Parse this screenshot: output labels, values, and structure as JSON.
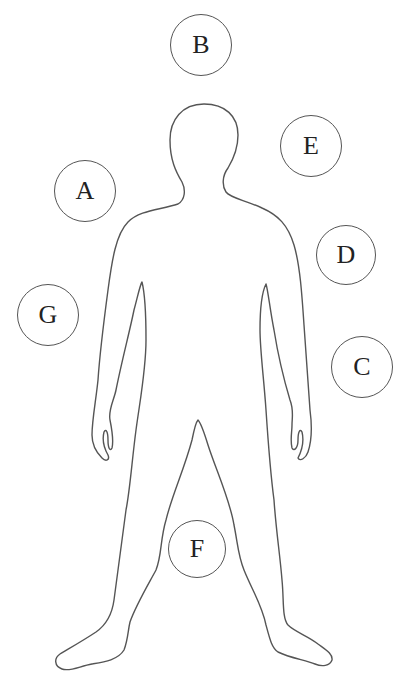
{
  "diagram": {
    "outline_color": "#555555",
    "labels": [
      {
        "id": "A",
        "text": "A",
        "cx": 85,
        "cy": 191,
        "r": 31
      },
      {
        "id": "B",
        "text": "B",
        "cx": 201,
        "cy": 45,
        "r": 31
      },
      {
        "id": "C",
        "text": "C",
        "cx": 362,
        "cy": 367,
        "r": 31
      },
      {
        "id": "D",
        "text": "D",
        "cx": 346,
        "cy": 255,
        "r": 30
      },
      {
        "id": "E",
        "text": "E",
        "cx": 311,
        "cy": 146,
        "r": 31
      },
      {
        "id": "F",
        "text": "F",
        "cx": 197,
        "cy": 549,
        "r": 29
      },
      {
        "id": "G",
        "text": "G",
        "cx": 48,
        "cy": 315,
        "r": 31
      }
    ]
  }
}
